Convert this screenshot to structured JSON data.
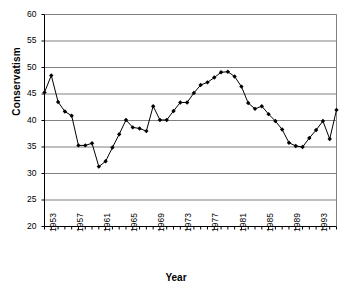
{
  "chart_data": {
    "type": "line",
    "title": "",
    "xlabel": "Year",
    "ylabel": "Conservatism",
    "ylim": [
      20,
      60
    ],
    "ytick_values": [
      20,
      25,
      30,
      35,
      40,
      45,
      50,
      55,
      60
    ],
    "ytick_labels": [
      "20",
      "25",
      "30",
      "35",
      "40",
      "45",
      "50",
      "55",
      "60"
    ],
    "xlim": [
      1953,
      1996
    ],
    "xtick_labels": [
      "1953",
      "1957",
      "1961",
      "1965",
      "1969",
      "1973",
      "1977",
      "1981",
      "1985",
      "1989",
      "1993"
    ],
    "xtick_values": [
      1953,
      1957,
      1961,
      1965,
      1969,
      1973,
      1977,
      1981,
      1985,
      1989,
      1993
    ],
    "grid": "horizontal",
    "legend": "none",
    "marker": "filled-diamond",
    "line_color": "#000000",
    "grid_color": "#808080",
    "x": [
      1953,
      1954,
      1955,
      1956,
      1957,
      1958,
      1959,
      1960,
      1961,
      1962,
      1963,
      1964,
      1965,
      1966,
      1967,
      1968,
      1969,
      1970,
      1971,
      1972,
      1973,
      1974,
      1975,
      1976,
      1977,
      1978,
      1979,
      1980,
      1981,
      1982,
      1983,
      1984,
      1985,
      1986,
      1987,
      1988,
      1989,
      1990,
      1991,
      1992,
      1993,
      1994,
      1995,
      1996
    ],
    "values": [
      45.3,
      48.5,
      43.5,
      41.7,
      40.9,
      35.3,
      35.3,
      35.7,
      31.3,
      32.3,
      34.9,
      37.4,
      40.1,
      38.7,
      38.5,
      38.0,
      42.7,
      40.1,
      40.1,
      41.8,
      43.4,
      43.4,
      45.2,
      46.7,
      47.2,
      48.1,
      49.1,
      49.2,
      48.3,
      46.4,
      43.3,
      42.2,
      42.7,
      41.2,
      39.9,
      38.3,
      35.8,
      35.2,
      35.0,
      36.7,
      38.2,
      39.9,
      36.5,
      42.0
    ],
    "series": [
      {
        "name": "Conservatism",
        "values": [
          45.3,
          48.5,
          43.5,
          41.7,
          40.9,
          35.3,
          35.3,
          35.7,
          31.3,
          32.3,
          34.9,
          37.4,
          40.1,
          38.7,
          38.5,
          38.0,
          42.7,
          40.1,
          40.1,
          41.8,
          43.4,
          43.4,
          45.2,
          46.7,
          47.2,
          48.1,
          49.1,
          49.2,
          48.3,
          46.4,
          43.3,
          42.2,
          42.7,
          41.2,
          39.9,
          38.3,
          35.8,
          35.2,
          35.0,
          36.7,
          38.2,
          39.9,
          36.5,
          42.0
        ]
      }
    ]
  }
}
